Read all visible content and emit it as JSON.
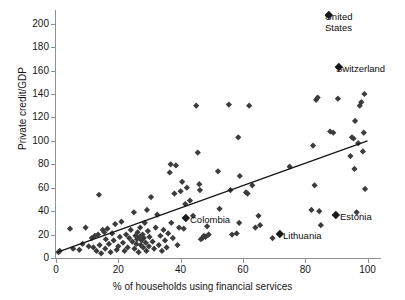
{
  "chart_data": {
    "type": "scatter",
    "title": "",
    "xlabel": "% of households using financial services",
    "ylabel": "Private credit/GDP",
    "xlim": [
      0,
      104
    ],
    "ylim": [
      0,
      210
    ],
    "xticks": [
      0,
      20,
      40,
      60,
      80,
      100
    ],
    "yticks": [
      0,
      20,
      40,
      60,
      80,
      100,
      120,
      140,
      160,
      180,
      200
    ],
    "grid": false,
    "legend": "none",
    "marker": "diamond",
    "marker_color": "#3c3c3c",
    "trendline": {
      "type": "linear",
      "color": "#151515",
      "x": [
        0.5,
        100
      ],
      "y": [
        5,
        100
      ]
    },
    "annotations": [
      {
        "label": "United\nStates",
        "x": 86,
        "y": 205,
        "marker_px": [
          330,
          16
        ]
      },
      {
        "label": "Switzerland",
        "x": 87,
        "y": 158,
        "marker_px": [
          340,
          68
        ]
      },
      {
        "label": "Colombia",
        "x": 41,
        "y": 25,
        "marker_px": [
          187,
          219
        ]
      },
      {
        "label": "Lithuania",
        "x": 69.5,
        "y": 17,
        "marker_px": [
          281,
          235
        ]
      },
      {
        "label": "Estonia",
        "x": 85,
        "y": 28,
        "marker_px": [
          337,
          216
        ]
      }
    ],
    "points": [
      [
        0.8,
        5
      ],
      [
        1.2,
        6
      ],
      [
        4.5,
        25
      ],
      [
        5.5,
        8
      ],
      [
        7.5,
        7
      ],
      [
        8.5,
        12
      ],
      [
        9.5,
        26
      ],
      [
        10.5,
        10
      ],
      [
        11.5,
        17
      ],
      [
        12,
        9
      ],
      [
        12.5,
        19
      ],
      [
        13,
        6
      ],
      [
        13.5,
        20
      ],
      [
        13.8,
        54
      ],
      [
        14,
        11
      ],
      [
        14.5,
        4
      ],
      [
        15,
        24
      ],
      [
        15.5,
        22
      ],
      [
        15.8,
        8
      ],
      [
        16,
        16
      ],
      [
        16.5,
        25
      ],
      [
        17,
        12
      ],
      [
        17.5,
        5
      ],
      [
        18,
        21
      ],
      [
        18.5,
        15
      ],
      [
        19,
        29
      ],
      [
        19.5,
        7
      ],
      [
        20,
        10
      ],
      [
        20.5,
        18
      ],
      [
        21,
        31
      ],
      [
        21.5,
        13
      ],
      [
        22,
        6
      ],
      [
        22.5,
        20
      ],
      [
        23,
        9
      ],
      [
        23.5,
        17
      ],
      [
        24,
        24
      ],
      [
        24.5,
        14
      ],
      [
        25,
        39
      ],
      [
        25.2,
        8
      ],
      [
        25.5,
        19
      ],
      [
        25.8,
        12
      ],
      [
        26,
        16
      ],
      [
        26.2,
        22
      ],
      [
        26.5,
        5
      ],
      [
        26.8,
        18
      ],
      [
        27,
        26
      ],
      [
        27.2,
        11
      ],
      [
        27.5,
        15
      ],
      [
        27.8,
        20
      ],
      [
        28,
        9
      ],
      [
        28.2,
        17
      ],
      [
        28.5,
        30
      ],
      [
        28.8,
        13
      ],
      [
        29,
        6
      ],
      [
        29.2,
        41
      ],
      [
        29.5,
        23
      ],
      [
        29.8,
        10
      ],
      [
        30,
        18
      ],
      [
        30.5,
        52
      ],
      [
        31,
        14
      ],
      [
        31.5,
        8
      ],
      [
        32,
        26
      ],
      [
        32.5,
        37
      ],
      [
        33,
        11
      ],
      [
        33.5,
        19
      ],
      [
        34,
        6
      ],
      [
        34.5,
        24
      ],
      [
        35,
        15
      ],
      [
        35.5,
        9
      ],
      [
        36,
        21
      ],
      [
        36.5,
        73
      ],
      [
        36.8,
        80
      ],
      [
        37,
        30
      ],
      [
        37.5,
        17
      ],
      [
        38,
        55
      ],
      [
        38.5,
        79
      ],
      [
        39,
        11
      ],
      [
        39.5,
        26
      ],
      [
        40,
        57
      ],
      [
        40.5,
        65
      ],
      [
        41,
        25
      ],
      [
        41.5,
        46
      ],
      [
        42,
        60
      ],
      [
        43,
        49
      ],
      [
        44,
        36
      ],
      [
        45,
        130
      ],
      [
        45.5,
        90
      ],
      [
        46,
        63
      ],
      [
        46.2,
        58
      ],
      [
        46.5,
        16
      ],
      [
        47,
        17
      ],
      [
        47.5,
        19
      ],
      [
        48,
        18
      ],
      [
        48.5,
        27
      ],
      [
        49,
        20
      ],
      [
        52,
        74
      ],
      [
        52.5,
        42
      ],
      [
        55.5,
        131
      ],
      [
        56,
        58
      ],
      [
        56.5,
        20
      ],
      [
        58,
        21
      ],
      [
        58.5,
        103
      ],
      [
        58.8,
        30
      ],
      [
        59,
        70
      ],
      [
        61,
        56
      ],
      [
        61.5,
        55
      ],
      [
        62,
        130
      ],
      [
        63,
        62
      ],
      [
        64,
        26
      ],
      [
        65,
        36
      ],
      [
        65.5,
        28
      ],
      [
        69.5,
        17
      ],
      [
        75,
        78
      ],
      [
        82,
        41
      ],
      [
        82.5,
        96
      ],
      [
        83,
        62
      ],
      [
        83.5,
        135
      ],
      [
        84,
        137
      ],
      [
        84.5,
        40
      ],
      [
        85,
        28
      ],
      [
        88,
        108
      ],
      [
        89,
        107
      ],
      [
        90.5,
        136
      ],
      [
        94.5,
        87
      ],
      [
        95,
        103
      ],
      [
        95.5,
        102
      ],
      [
        95.8,
        76
      ],
      [
        96,
        117
      ],
      [
        96.5,
        39
      ],
      [
        97,
        98
      ],
      [
        97.5,
        130
      ],
      [
        98,
        133
      ],
      [
        98.5,
        91
      ],
      [
        98.8,
        107
      ],
      [
        99,
        140
      ],
      [
        99.2,
        59
      ]
    ]
  }
}
